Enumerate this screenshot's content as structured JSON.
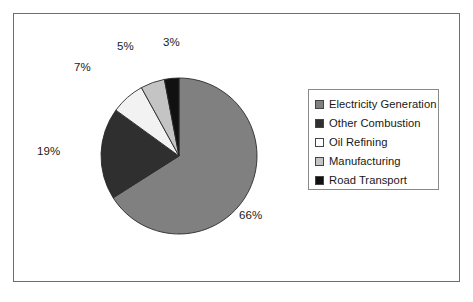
{
  "chart_data": {
    "type": "pie",
    "title": "",
    "subtitle": "",
    "xlabel": "",
    "ylabel": "",
    "grid": false,
    "legend_position": "right",
    "start_angle_deg": 0,
    "direction": "clockwise",
    "categories": [
      "Electricity Generation",
      "Other Combustion",
      "Oil Refining",
      "Manufacturing",
      "Road Transport"
    ],
    "values": [
      66,
      19,
      7,
      5,
      3
    ],
    "data_labels": [
      "66%",
      "19%",
      "7%",
      "5%",
      "3%"
    ],
    "colors": [
      "#808080",
      "#2f2f2f",
      "#f2f2f2",
      "#c4c4c4",
      "#111111"
    ],
    "units": "percent"
  },
  "legend": {
    "items": [
      {
        "label": "Electricity Generation",
        "color": "#808080"
      },
      {
        "label": "Other Combustion",
        "color": "#2f2f2f"
      },
      {
        "label": "Oil Refining",
        "color": "#ffffff"
      },
      {
        "label": "Manufacturing",
        "color": "#c4c4c4"
      },
      {
        "label": "Road Transport",
        "color": "#111111"
      }
    ]
  },
  "labels": {
    "pct_66": "66%",
    "pct_19": "19%",
    "pct_7": "7%",
    "pct_5": "5%",
    "pct_3": "3%"
  },
  "colors": {
    "frame_border": "#6e6e6e",
    "legend_border": "#8a8a8a",
    "background": "#ffffff",
    "text": "#1a1a1a"
  }
}
